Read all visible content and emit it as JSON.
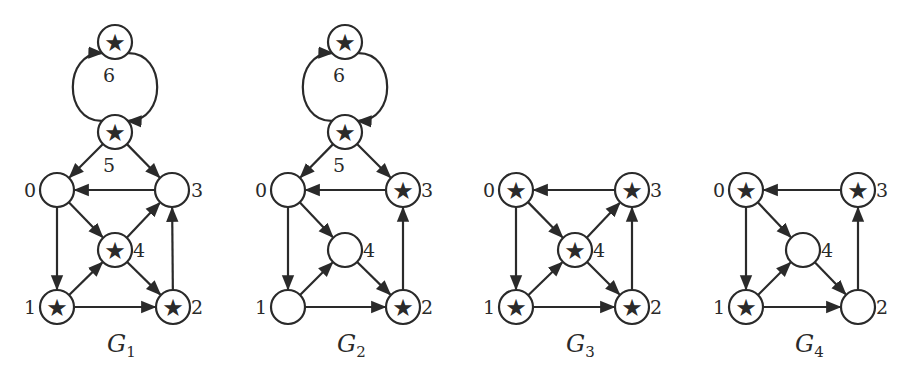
{
  "figure": {
    "star_glyph": "★",
    "colors": {
      "stroke": "#2a2a2a",
      "background": "#ffffff",
      "node_fill": "#ffffff"
    },
    "node_radius": 17,
    "graphs": [
      {
        "id": "G1",
        "caption": "G",
        "caption_sub": "1",
        "caption_pos": [
          107,
          352
        ],
        "nodes": [
          {
            "id": "0",
            "x": 57,
            "y": 190,
            "star": false,
            "label": "0",
            "lx": 30,
            "ly": 197
          },
          {
            "id": "1",
            "x": 57,
            "y": 307,
            "star": true,
            "label": "1",
            "lx": 30,
            "ly": 314
          },
          {
            "id": "2",
            "x": 173,
            "y": 307,
            "star": true,
            "label": "2",
            "lx": 197,
            "ly": 314
          },
          {
            "id": "3",
            "x": 172,
            "y": 190,
            "star": false,
            "label": "3",
            "lx": 197,
            "ly": 197
          },
          {
            "id": "4",
            "x": 115,
            "y": 250,
            "star": true,
            "label": "4",
            "lx": 139,
            "ly": 257
          },
          {
            "id": "5",
            "x": 115,
            "y": 132,
            "star": true,
            "label": "5",
            "lx": 109,
            "ly": 172
          },
          {
            "id": "6",
            "x": 115,
            "y": 42,
            "star": true,
            "label": "6",
            "lx": 109,
            "ly": 82
          }
        ],
        "edges": [
          {
            "from": "5",
            "to": "0"
          },
          {
            "from": "5",
            "to": "3"
          },
          {
            "from": "3",
            "to": "0"
          },
          {
            "from": "0",
            "to": "1"
          },
          {
            "from": "0",
            "to": "4"
          },
          {
            "from": "1",
            "to": "4"
          },
          {
            "from": "1",
            "to": "2"
          },
          {
            "from": "4",
            "to": "3"
          },
          {
            "from": "4",
            "to": "2"
          },
          {
            "from": "2",
            "to": "3"
          }
        ],
        "arcs": [
          {
            "from": "5",
            "to": "6",
            "side": "left"
          },
          {
            "from": "6",
            "to": "5",
            "side": "right"
          }
        ]
      },
      {
        "id": "G2",
        "caption": "G",
        "caption_sub": "2",
        "caption_pos": [
          337,
          352
        ],
        "nodes": [
          {
            "id": "0",
            "x": 288,
            "y": 190,
            "star": false,
            "label": "0",
            "lx": 261,
            "ly": 197
          },
          {
            "id": "1",
            "x": 288,
            "y": 307,
            "star": false,
            "label": "1",
            "lx": 261,
            "ly": 314
          },
          {
            "id": "2",
            "x": 403,
            "y": 307,
            "star": true,
            "label": "2",
            "lx": 427,
            "ly": 314
          },
          {
            "id": "3",
            "x": 403,
            "y": 190,
            "star": true,
            "label": "3",
            "lx": 427,
            "ly": 197
          },
          {
            "id": "4",
            "x": 345,
            "y": 250,
            "star": false,
            "label": "4",
            "lx": 369,
            "ly": 257
          },
          {
            "id": "5",
            "x": 345,
            "y": 132,
            "star": true,
            "label": "5",
            "lx": 339,
            "ly": 172
          },
          {
            "id": "6",
            "x": 345,
            "y": 42,
            "star": true,
            "label": "6",
            "lx": 339,
            "ly": 82
          }
        ],
        "edges": [
          {
            "from": "5",
            "to": "0"
          },
          {
            "from": "5",
            "to": "3"
          },
          {
            "from": "3",
            "to": "0"
          },
          {
            "from": "0",
            "to": "1"
          },
          {
            "from": "0",
            "to": "4"
          },
          {
            "from": "1",
            "to": "4"
          },
          {
            "from": "1",
            "to": "2"
          },
          {
            "from": "4",
            "to": "2"
          },
          {
            "from": "2",
            "to": "3"
          }
        ],
        "arcs": [
          {
            "from": "5",
            "to": "6",
            "side": "left"
          },
          {
            "from": "6",
            "to": "5",
            "side": "right"
          }
        ]
      },
      {
        "id": "G3",
        "caption": "G",
        "caption_sub": "3",
        "caption_pos": [
          566,
          352
        ],
        "nodes": [
          {
            "id": "0",
            "x": 516,
            "y": 190,
            "star": true,
            "label": "0",
            "lx": 489,
            "ly": 197
          },
          {
            "id": "1",
            "x": 516,
            "y": 307,
            "star": true,
            "label": "1",
            "lx": 489,
            "ly": 314
          },
          {
            "id": "2",
            "x": 632,
            "y": 307,
            "star": true,
            "label": "2",
            "lx": 656,
            "ly": 314
          },
          {
            "id": "3",
            "x": 632,
            "y": 190,
            "star": true,
            "label": "3",
            "lx": 656,
            "ly": 197
          },
          {
            "id": "4",
            "x": 575,
            "y": 250,
            "star": true,
            "label": "4",
            "lx": 599,
            "ly": 257
          }
        ],
        "edges": [
          {
            "from": "3",
            "to": "0"
          },
          {
            "from": "0",
            "to": "1"
          },
          {
            "from": "0",
            "to": "4"
          },
          {
            "from": "1",
            "to": "4"
          },
          {
            "from": "1",
            "to": "2"
          },
          {
            "from": "4",
            "to": "3"
          },
          {
            "from": "4",
            "to": "2"
          },
          {
            "from": "2",
            "to": "3"
          }
        ],
        "arcs": []
      },
      {
        "id": "G4",
        "caption": "G",
        "caption_sub": "4",
        "caption_pos": [
          795,
          352
        ],
        "nodes": [
          {
            "id": "0",
            "x": 746,
            "y": 190,
            "star": true,
            "label": "0",
            "lx": 719,
            "ly": 197
          },
          {
            "id": "1",
            "x": 746,
            "y": 307,
            "star": true,
            "label": "1",
            "lx": 719,
            "ly": 314
          },
          {
            "id": "2",
            "x": 858,
            "y": 307,
            "star": false,
            "label": "2",
            "lx": 882,
            "ly": 314
          },
          {
            "id": "3",
            "x": 858,
            "y": 190,
            "star": true,
            "label": "3",
            "lx": 882,
            "ly": 197
          },
          {
            "id": "4",
            "x": 803,
            "y": 250,
            "star": false,
            "label": "4",
            "lx": 827,
            "ly": 257
          }
        ],
        "edges": [
          {
            "from": "3",
            "to": "0"
          },
          {
            "from": "0",
            "to": "1"
          },
          {
            "from": "0",
            "to": "4"
          },
          {
            "from": "1",
            "to": "4"
          },
          {
            "from": "1",
            "to": "2"
          },
          {
            "from": "4",
            "to": "2"
          },
          {
            "from": "2",
            "to": "3"
          }
        ],
        "arcs": []
      }
    ]
  }
}
